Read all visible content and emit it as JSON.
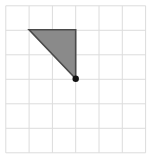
{
  "figure": {
    "canvas": {
      "width": 152,
      "height": 161,
      "background": "#ffffff"
    },
    "grid": {
      "columns": 6,
      "rows": 6,
      "left": 5.8,
      "top": 5.8,
      "cell_width": 23.3,
      "cell_height": 24.5,
      "line_color": "#dcdcdc",
      "line_width": 1,
      "visible": true
    },
    "shape": {
      "kind": "right-triangle",
      "fill": "#8a8a8a",
      "stroke": "#4a4a4a",
      "stroke_width": 1.6,
      "vertices": [
        {
          "name": "top-left-vertex",
          "x": 29.1,
          "y": 29.8,
          "grid": [
            1,
            1
          ]
        },
        {
          "name": "top-right-vertex",
          "x": 75.7,
          "y": 29.8,
          "grid": [
            3,
            1
          ]
        },
        {
          "name": "right-angle-vertex",
          "x": 75.7,
          "y": 78.8,
          "grid": [
            3,
            3
          ]
        }
      ],
      "legs": {
        "horizontal_cells": 2,
        "vertical_cells": 2
      }
    },
    "marker": {
      "name": "vertex-dot",
      "x": 75.7,
      "y": 78.8,
      "radius": 3.2,
      "color": "#111111"
    }
  }
}
